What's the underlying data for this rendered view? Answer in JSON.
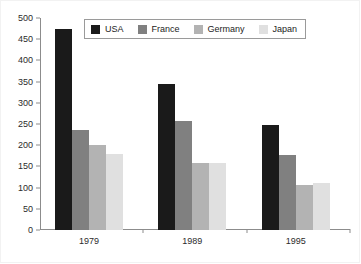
{
  "chart_data": {
    "type": "bar",
    "title": "",
    "subtitle": "",
    "xlabel": "",
    "ylabel": "",
    "categories": [
      "1979",
      "1989",
      "1995"
    ],
    "series": [
      {
        "name": "USA",
        "color": "#1a1a1a",
        "values": [
          475,
          345,
          247
        ]
      },
      {
        "name": "France",
        "color": "#808080",
        "values": [
          237,
          256,
          176
        ]
      },
      {
        "name": "Germany",
        "color": "#b3b3b3",
        "values": [
          200,
          157,
          106
        ]
      },
      {
        "name": "Japan",
        "color": "#e0e0e0",
        "values": [
          180,
          157,
          110
        ]
      }
    ],
    "ylim": [
      0,
      500
    ],
    "ytick_step": 50,
    "yticks": [
      0,
      50,
      100,
      150,
      200,
      250,
      300,
      350,
      400,
      450,
      500
    ],
    "ytick_labels": [
      "0",
      "50",
      "100",
      "150",
      "200",
      "250",
      "300",
      "350",
      "400",
      "450",
      "500"
    ],
    "grid": false,
    "legend_position": "top-center",
    "legend_entries": [
      "USA",
      "France",
      "Germany",
      "Japan"
    ],
    "bar_grouping": "grouped",
    "axis_color": "#8c8c8c",
    "background_color": "#ffffff",
    "text_color": "#2b2b2b"
  }
}
